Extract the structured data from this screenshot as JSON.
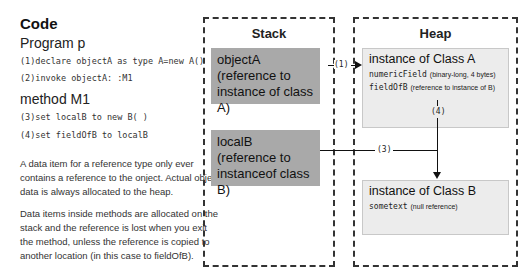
{
  "code": {
    "title": "Code",
    "program_title": "Program p",
    "program_lines": [
      "(1)declare objectA as type A=new A()",
      "(2)invoke objectA: :M1"
    ],
    "method_title": "method M1",
    "method_lines": [
      "(3)set localB to new B( )",
      "(4)set fieldOfB to localB"
    ],
    "paragraphs": [
      "A data item for a reference type only ever contains a reference to the onject. Actual object data is always allocated to the heap.",
      "Data items inside methods are allocated on the stack and the reference is lost when you exit the method, unless the reference is copied to another location (in this case to fieldOfB)."
    ]
  },
  "stack": {
    "title": "Stack",
    "items": [
      {
        "name": "objectA",
        "desc": "(reference to instance of class A)"
      },
      {
        "name": "localB",
        "desc": "(reference to instanceof class B)"
      }
    ]
  },
  "heap": {
    "title": "Heap",
    "instances": [
      {
        "title": "instance of Class A",
        "fields": [
          {
            "name": "numericField",
            "desc": "(binary-long, 4 bytes)"
          },
          {
            "name": "fieldOfB",
            "desc": "(reference to instance of B)"
          }
        ]
      },
      {
        "title": "instance of Class B",
        "fields": [
          {
            "name": "sometext",
            "desc": "(null reference)"
          }
        ]
      }
    ]
  },
  "arrows": {
    "a1": "(1)",
    "a3": "(3)",
    "a4": "(4)"
  },
  "colors": {
    "stack_item": "#a9a9a9",
    "heap_item": "#ececec",
    "border": "#333333"
  }
}
